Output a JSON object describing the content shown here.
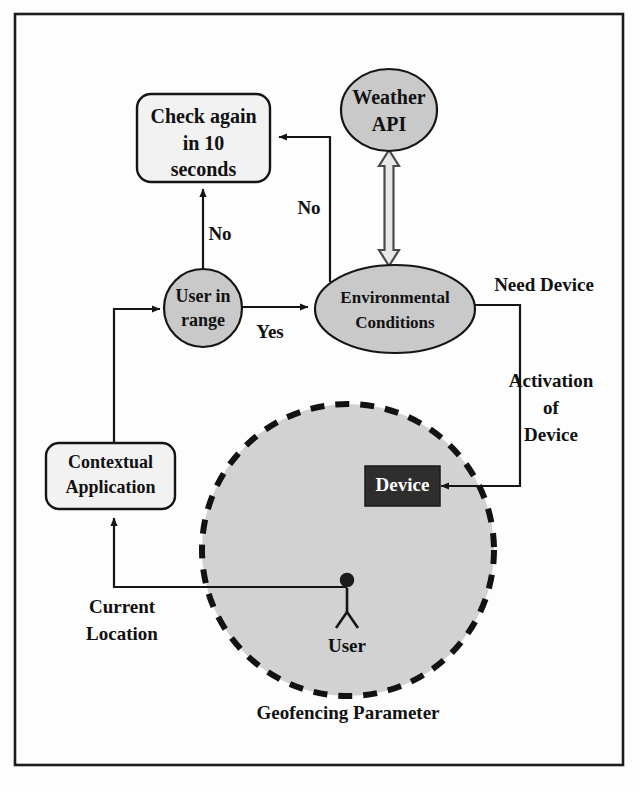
{
  "diagram": {
    "frame": {
      "x": 15,
      "y": 14,
      "width": 608,
      "height": 751
    },
    "nodes": {
      "check_again": {
        "label_line1": "Check again",
        "label_line2": "in 10",
        "label_line3": "seconds",
        "shape": "rounded-rect",
        "fill": "#f2f2f2"
      },
      "weather_api": {
        "label_line1": "Weather",
        "label_line2": "API",
        "shape": "ellipse",
        "fill": "#c9c9c9"
      },
      "user_in_range": {
        "label_line1": "User in",
        "label_line2": "range",
        "shape": "circle",
        "fill": "#c9c9c9"
      },
      "environmental_conditions": {
        "label_line1": "Environmental",
        "label_line2": "Conditions",
        "shape": "ellipse",
        "fill": "#c9c9c9"
      },
      "contextual_application": {
        "label_line1": "Contextual",
        "label_line2": "Application",
        "shape": "rounded-rect",
        "fill": "#f2f2f2"
      },
      "device": {
        "label": "Device",
        "shape": "rect",
        "fill": "#2e2e2e",
        "text_color": "#ffffff"
      },
      "user_actor": {
        "label": "User",
        "shape": "stick-figure"
      },
      "geofence": {
        "label": "Geofencing Parameter",
        "shape": "dashed-circle",
        "fill": "#d2d2d2"
      }
    },
    "edges": [
      {
        "id": "user-in-range-no",
        "label": "No",
        "from": "user_in_range",
        "to": "check_again"
      },
      {
        "id": "env-conditions-no",
        "label": "No",
        "from": "environmental_conditions",
        "to": "check_again"
      },
      {
        "id": "user-in-range-yes",
        "label": "Yes",
        "from": "user_in_range",
        "to": "environmental_conditions"
      },
      {
        "id": "need-device",
        "label": "Need Device",
        "from": "environmental_conditions",
        "to": "device"
      },
      {
        "id": "activation-of-device",
        "label_line1": "Activation",
        "label_line2": "of",
        "label_line3": "Device",
        "from": "environmental_conditions",
        "to": "device"
      },
      {
        "id": "current-location",
        "label_line1": "Current",
        "label_line2": "Location",
        "from": "user_actor",
        "to": "contextual_application"
      },
      {
        "id": "contextual-to-user-in-range",
        "label": "",
        "from": "contextual_application",
        "to": "user_in_range"
      },
      {
        "id": "weather-api-link",
        "label": "",
        "from": "weather_api",
        "to": "environmental_conditions",
        "style": "double-block-arrow"
      }
    ]
  }
}
